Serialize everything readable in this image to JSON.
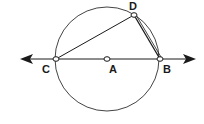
{
  "diagram": {
    "type": "circle-geometry",
    "circle": {
      "center_label": "A",
      "cx": 107,
      "cy": 59,
      "r": 52
    },
    "points": [
      {
        "label": "C",
        "x": 56,
        "y": 59,
        "label_x": 42,
        "label_y": 72
      },
      {
        "label": "A",
        "x": 107,
        "y": 59,
        "label_x": 109,
        "label_y": 72
      },
      {
        "label": "B",
        "x": 160,
        "y": 59,
        "label_x": 163,
        "label_y": 72
      },
      {
        "label": "D",
        "x": 134,
        "y": 15,
        "label_x": 129,
        "label_y": 10
      }
    ],
    "line": {
      "name": "line CB",
      "x1": 22,
      "x2": 194,
      "y": 59,
      "arrows": "both"
    },
    "segments": [
      "CD",
      "DB"
    ],
    "colors": {
      "stroke": "#1a1a1a",
      "circle": "#444444",
      "background": "#ffffff"
    }
  }
}
